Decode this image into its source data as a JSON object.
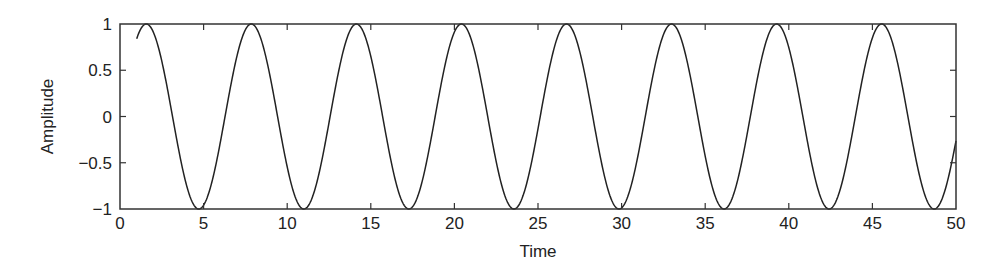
{
  "chart_data": {
    "type": "line",
    "title": "",
    "xlabel": "Time",
    "ylabel": "Amplitude",
    "xlim": [
      0,
      50
    ],
    "ylim": [
      -1,
      1
    ],
    "grid": false,
    "legend": null,
    "x_ticks": [
      0,
      5,
      10,
      15,
      20,
      25,
      30,
      35,
      40,
      45,
      50
    ],
    "x_tick_labels": [
      "0",
      "5",
      "10",
      "15",
      "20",
      "25",
      "30",
      "35",
      "40",
      "45",
      "50"
    ],
    "y_ticks": [
      1,
      0.5,
      0,
      -0.5,
      -1
    ],
    "y_tick_labels": [
      "1",
      "0.5",
      "0",
      "−0.5",
      "−1"
    ],
    "series": [
      {
        "name": "sin(t)",
        "function": "sin(t)",
        "x_range": [
          1,
          50
        ],
        "color": "#222222",
        "sample_points": [
          {
            "x": 1,
            "y": 0.84
          },
          {
            "x": 1.57,
            "y": 1
          },
          {
            "x": 4.71,
            "y": -1
          },
          {
            "x": 7.85,
            "y": 1
          },
          {
            "x": 10.99,
            "y": -1
          },
          {
            "x": 14.14,
            "y": 1
          },
          {
            "x": 17.28,
            "y": -1
          },
          {
            "x": 20.42,
            "y": 1
          },
          {
            "x": 23.56,
            "y": -1
          },
          {
            "x": 26.7,
            "y": 1
          },
          {
            "x": 29.85,
            "y": -1
          },
          {
            "x": 32.99,
            "y": 1
          },
          {
            "x": 36.13,
            "y": -1
          },
          {
            "x": 39.27,
            "y": 1
          },
          {
            "x": 42.41,
            "y": -1
          },
          {
            "x": 45.55,
            "y": 1
          },
          {
            "x": 48.69,
            "y": -1
          },
          {
            "x": 50,
            "y": -0.26
          }
        ]
      }
    ]
  },
  "colors": {
    "line": "#222222",
    "axes": "#333333",
    "background": "#ffffff"
  }
}
